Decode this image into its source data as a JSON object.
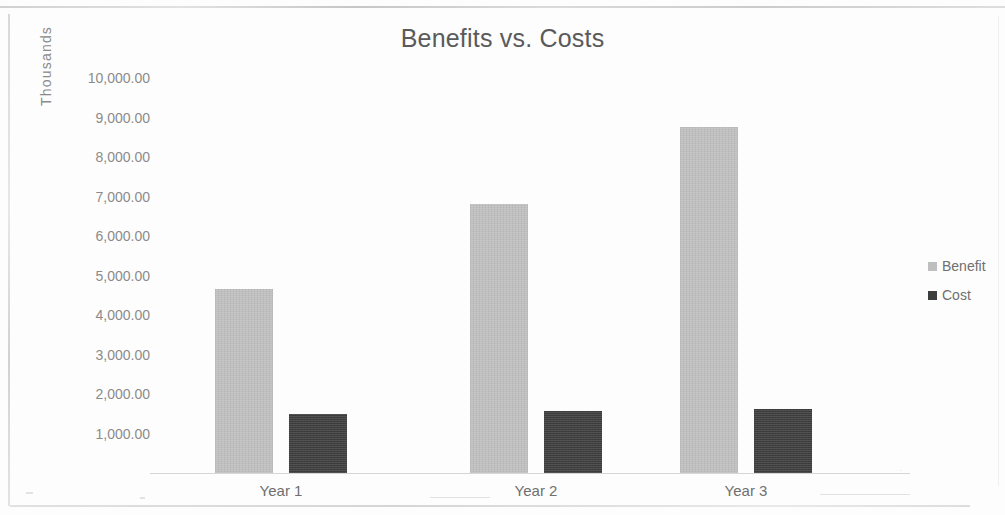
{
  "chart_data": {
    "type": "bar",
    "title": "Benefits vs. Costs",
    "xlabel": "",
    "ylabel": "Thousands",
    "categories": [
      "Year 1",
      "Year 2",
      "Year 3"
    ],
    "series": [
      {
        "name": "Benefit",
        "color": "#bfbfbf",
        "values": [
          4670,
          6800,
          8750
        ]
      },
      {
        "name": "Cost",
        "color": "#3d3d3d",
        "values": [
          1500,
          1560,
          1620
        ]
      }
    ],
    "ylim": [
      0,
      10000
    ],
    "ytick_values": [
      10000,
      9000,
      8000,
      7000,
      6000,
      5000,
      4000,
      3000,
      2000,
      1000
    ],
    "ytick_labels": [
      "10,000.00",
      "9,000.00",
      "8,000.00",
      "7,000.00",
      "6,000.00",
      "5,000.00",
      "4,000.00",
      "3,000.00",
      "2,000.00",
      "1,000.00"
    ],
    "grid": false,
    "legend_position": "right"
  },
  "legend": {
    "items": [
      {
        "label": "Benefit",
        "color": "#bfbfbf"
      },
      {
        "label": "Cost",
        "color": "#3d3d3d"
      }
    ]
  },
  "colors": {
    "benefit": "#bfbfbf",
    "cost": "#3d3d3d",
    "title_text": "#5a5a5a",
    "tick_text": "#8b8b8b",
    "axis_line": "#d6d6d6",
    "page_background": "#fdfdfd"
  }
}
